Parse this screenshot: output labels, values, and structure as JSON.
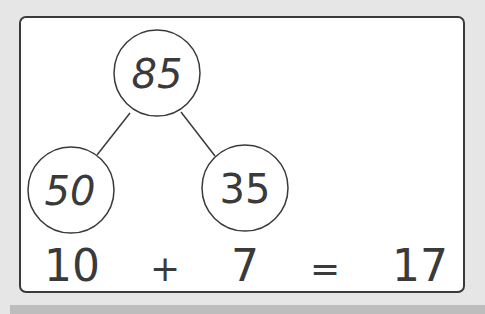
{
  "diagram": {
    "root": {
      "value": "85"
    },
    "children": [
      {
        "value": "50"
      },
      {
        "value": "35"
      }
    ],
    "equation": {
      "left": "10",
      "operator": "+",
      "right": "7",
      "equals": "=",
      "result": "17"
    }
  }
}
